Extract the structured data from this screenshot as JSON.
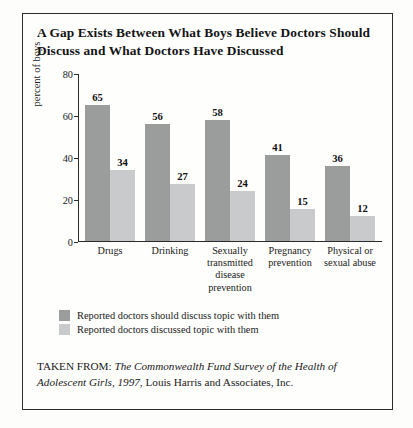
{
  "chart_data": {
    "type": "bar",
    "title": "A Gap Exists Between What Boys Believe Doctors Should Discuss and What Doctors Have Discussed",
    "xlabel": "",
    "ylabel": "percent of boys",
    "ylim": [
      0,
      80
    ],
    "yticks": [
      80,
      60,
      40,
      20,
      0
    ],
    "grid": false,
    "legend_position": "bottom-left",
    "categories": [
      "Drugs",
      "Drinking",
      "Sexually transmitted disease prevention",
      "Pregnancy prevention",
      "Physical or sexual abuse"
    ],
    "series": [
      {
        "name": "Reported doctors should discuss topic with them",
        "color": "#9b9c9c",
        "values": [
          65,
          56,
          58,
          41,
          36
        ]
      },
      {
        "name": "Reported doctors discussed topic with them",
        "color": "#c9cacb",
        "values": [
          34,
          27,
          24,
          15,
          12
        ]
      }
    ]
  },
  "source": {
    "prefix": "TAKEN FROM:",
    "italic": "The Commonwealth Fund Survey of the Health of Adolescent Girls, 1997",
    "suffix": ", Louis Harris and Associates, Inc."
  }
}
